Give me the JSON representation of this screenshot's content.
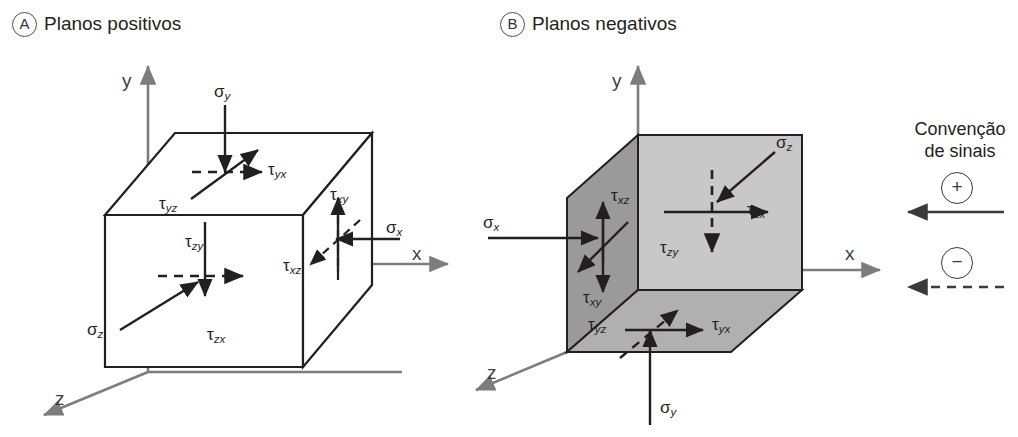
{
  "panels": [
    {
      "badge": "A",
      "title": "Planos positivos"
    },
    {
      "badge": "B",
      "title": "Planos negativos"
    }
  ],
  "axes": {
    "x": "x",
    "y": "y",
    "z": "z"
  },
  "legend": {
    "title_line1": "Convenção",
    "title_line2": "de sinais",
    "positive_symbol": "+",
    "negative_symbol": "−"
  },
  "panel_a_labels": {
    "sigma_y": {
      "base": "σ",
      "sub": "y"
    },
    "sigma_x": {
      "base": "σ",
      "sub": "x"
    },
    "sigma_z": {
      "base": "σ",
      "sub": "z"
    },
    "tau_yx": {
      "base": "τ",
      "sub": "yx"
    },
    "tau_yz": {
      "base": "τ",
      "sub": "yz"
    },
    "tau_xy": {
      "base": "τ",
      "sub": "xy"
    },
    "tau_xz": {
      "base": "τ",
      "sub": "xz"
    },
    "tau_zy": {
      "base": "τ",
      "sub": "zy"
    },
    "tau_zx": {
      "base": "τ",
      "sub": "zx"
    }
  },
  "panel_b_labels": {
    "sigma_z": {
      "base": "σ",
      "sub": "z"
    },
    "sigma_x": {
      "base": "σ",
      "sub": "x"
    },
    "sigma_y": {
      "base": "σ",
      "sub": "y"
    },
    "tau_zx": {
      "base": "τ",
      "sub": "zx"
    },
    "tau_zy": {
      "base": "τ",
      "sub": "zy"
    },
    "tau_xz": {
      "base": "τ",
      "sub": "xz"
    },
    "tau_xy": {
      "base": "τ",
      "sub": "xy"
    },
    "tau_yz": {
      "base": "τ",
      "sub": "yz"
    },
    "tau_yx": {
      "base": "τ",
      "sub": "yx"
    }
  },
  "colors": {
    "stroke": "#231f20",
    "axis": "#7d7d7d",
    "face_dark": "#9a9a9a",
    "face_light": "#c8c8c8",
    "face_bottom": "#b0b0b0",
    "face_white": "#ffffff"
  }
}
